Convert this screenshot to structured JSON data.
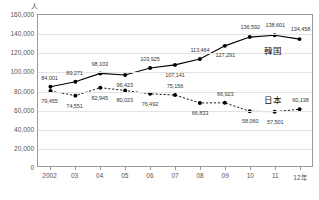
{
  "chart_data": {
    "type": "line",
    "title": "",
    "subtitle": "",
    "xlabel": "",
    "ylabel": "人",
    "unit_label": "人",
    "x": [
      "2002",
      "03",
      "04",
      "05",
      "06",
      "07",
      "08",
      "09",
      "10",
      "11",
      "12年"
    ],
    "categories": [
      "2002",
      "03",
      "04",
      "05",
      "06",
      "07",
      "08",
      "09",
      "10",
      "11",
      "12年"
    ],
    "ylim": [
      0,
      160000
    ],
    "ytick_labels": [
      "0",
      "20,000",
      "40,000",
      "60,000",
      "80,000",
      "100,000",
      "120,000",
      "140,000",
      "160,000"
    ],
    "ytick_values": [
      0,
      20000,
      40000,
      60000,
      80000,
      100000,
      120000,
      140000,
      160000
    ],
    "grid": true,
    "grid_axis": "y",
    "legend_position": "inline-right",
    "series": [
      {
        "name": "韓国",
        "style": "solid",
        "marker": "filled-circle",
        "color": "#000000",
        "values": [
          84001,
          89271,
          98103,
          96423,
          103925,
          107141,
          113464,
          127291,
          136592,
          138601,
          134458
        ],
        "labels": [
          "84,001",
          "89,271",
          "98,103",
          "96,423",
          "103,925",
          "107,141",
          "113,464",
          "127,291",
          "136,592",
          "138,601",
          "134,458"
        ]
      },
      {
        "name": "日本",
        "style": "dotted",
        "marker": "filled-circle",
        "color": "#000000",
        "values": [
          79455,
          74551,
          82945,
          80023,
          76492,
          75156,
          66833,
          66923,
          58060,
          57501,
          60138
        ],
        "labels": [
          "79,455",
          "74,551",
          "82,945",
          "80,023",
          "76,492",
          "75,156",
          "66,833",
          "66,923",
          "58,060",
          "57,501",
          "60,138"
        ]
      }
    ],
    "annotations": [
      {
        "text": "韓国",
        "series": "韓国"
      },
      {
        "text": "日本",
        "series": "日本"
      }
    ]
  }
}
